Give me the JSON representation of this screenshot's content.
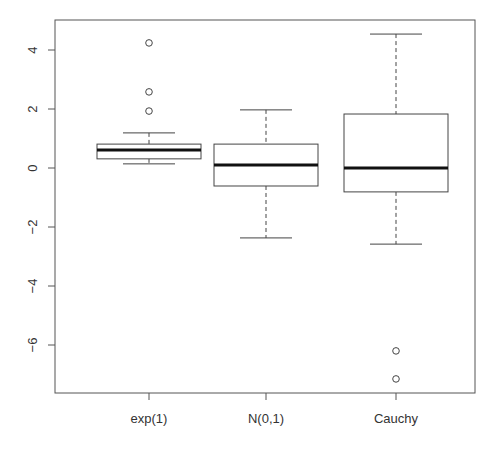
{
  "chart_data": {
    "type": "boxplot",
    "title": "",
    "xlabel": "",
    "ylabel": "",
    "categories": [
      "exp(1)",
      "N(0,1)",
      "Cauchy"
    ],
    "ylim": [
      -7.5,
      4.9
    ],
    "yticks": [
      -6,
      -4,
      -2,
      0,
      2,
      4
    ],
    "ytick_labels": [
      "-6",
      "-4",
      "-2",
      "0",
      "2",
      "4"
    ],
    "grid": false,
    "legend": null,
    "boxes": [
      {
        "name": "exp(1)",
        "whisker_low": 0.14,
        "q1": 0.31,
        "median": 0.61,
        "q3": 0.81,
        "whisker_high": 1.19,
        "outliers": [
          1.93,
          2.58,
          4.24
        ]
      },
      {
        "name": "N(0,1)",
        "whisker_low": -2.37,
        "q1": -0.61,
        "median": 0.1,
        "q3": 0.81,
        "whisker_high": 1.97,
        "outliers": []
      },
      {
        "name": "Cauchy",
        "whisker_low": -2.58,
        "q1": -0.81,
        "median": 0.0,
        "q3": 1.83,
        "whisker_high": 4.54,
        "outliers": [
          -6.2,
          -7.15
        ]
      }
    ]
  },
  "colors": {
    "axis": "#555555",
    "box": "#444444",
    "median": "#111111",
    "text": "#333333",
    "background": "#ffffff"
  }
}
